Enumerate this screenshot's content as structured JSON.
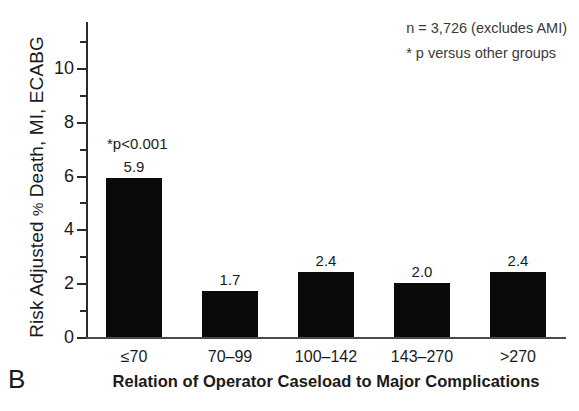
{
  "panel": {
    "label": "B"
  },
  "notes": {
    "sample": "n = 3,726 (excludes AMI)",
    "footnote": "* p versus other groups"
  },
  "annotation": {
    "significance": "*p<0.001"
  },
  "axes": {
    "y_title_prefix": "Risk Adjusted ",
    "y_title_percent": "%",
    "y_title_suffix": " Death, MI, ECABG",
    "x_title": "Relation of Operator Caseload to Major Complications"
  },
  "chart_data": {
    "type": "bar",
    "title": "",
    "subtitle": "",
    "xlabel": "Relation of Operator Caseload to Major Complications",
    "ylabel": "Risk Adjusted % Death, MI, ECABG",
    "categories": [
      "≤70",
      "70–99",
      "100–142",
      "143–270",
      ">270"
    ],
    "values": [
      5.9,
      1.7,
      2.4,
      2.0,
      2.4
    ],
    "value_labels": [
      "5.9",
      "1.7",
      "2.4",
      "2.0",
      "2.4"
    ],
    "ylim": [
      0,
      11
    ],
    "yticks": [
      0,
      2,
      4,
      6,
      8,
      10
    ],
    "ytick_labels": [
      "0",
      "2",
      "4",
      "6",
      "8",
      "10"
    ],
    "yminor_ticks": [
      1,
      3,
      5,
      7,
      9,
      11
    ],
    "grid": false,
    "legend": "none",
    "bar_color": "#0a0a0a",
    "annotations": [
      {
        "text": "*p<0.001",
        "category": "≤70"
      },
      {
        "text": "n = 3,726 (excludes AMI)",
        "position": "top-right"
      },
      {
        "text": "* p versus other groups",
        "position": "top-right"
      }
    ]
  }
}
